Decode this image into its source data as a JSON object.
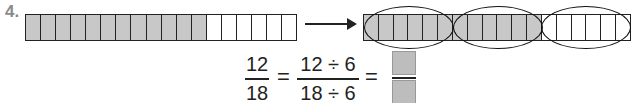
{
  "problem": {
    "number": "4."
  },
  "left_bar": {
    "total_cells": 18,
    "shaded_cells": 12
  },
  "right_bar": {
    "total_cells": 18,
    "shaded_cells": 12,
    "groups": 3,
    "group_size": 6
  },
  "equation": {
    "frac1": {
      "num": "12",
      "den": "18"
    },
    "eq": "=",
    "frac2": {
      "num": "12 ÷ 6",
      "den": "18 ÷ 6"
    },
    "answer": {
      "num": "",
      "den": ""
    }
  },
  "colors": {
    "shade": "#c8c8c8",
    "line": "#222222"
  }
}
